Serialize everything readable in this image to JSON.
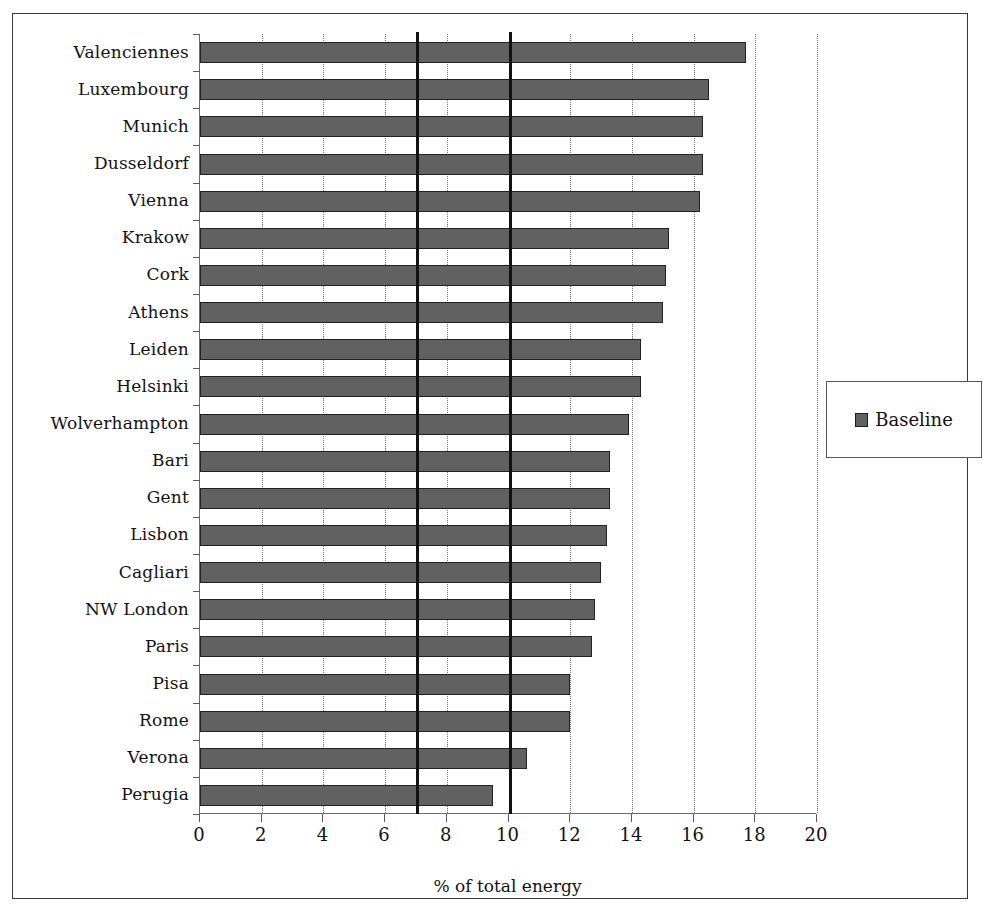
{
  "chart_data": {
    "type": "bar",
    "orientation": "horizontal",
    "title": "",
    "xlabel": "% of total energy",
    "ylabel": "",
    "xlim": [
      0,
      20
    ],
    "ylim": null,
    "grid": true,
    "grid_axis": "x",
    "xticks": [
      0,
      2,
      4,
      6,
      8,
      10,
      12,
      14,
      16,
      18,
      20
    ],
    "xtick_labels": [
      "0",
      "2",
      "4",
      "6",
      "8",
      "10",
      "12",
      "14",
      "16",
      "18",
      "20"
    ],
    "legend": {
      "position": "right",
      "entries": [
        {
          "label": "Baseline",
          "color": "#616161"
        }
      ]
    },
    "reference_lines": [
      {
        "value": 7,
        "color": "#111111"
      },
      {
        "value": 10,
        "color": "#111111"
      }
    ],
    "categories": [
      "Valenciennes",
      "Luxembourg",
      "Munich",
      "Dusseldorf",
      "Vienna",
      "Krakow",
      "Cork",
      "Athens",
      "Leiden",
      "Helsinki",
      "Wolverhampton",
      "Bari",
      "Gent",
      "Lisbon",
      "Cagliari",
      "NW London",
      "Paris",
      "Pisa",
      "Rome",
      "Verona",
      "Perugia"
    ],
    "series": [
      {
        "name": "Baseline",
        "color": "#616161",
        "values": [
          17.7,
          16.5,
          16.3,
          16.3,
          16.2,
          15.2,
          15.1,
          15.0,
          14.3,
          14.3,
          13.9,
          13.3,
          13.3,
          13.2,
          13.0,
          12.8,
          12.7,
          12.0,
          12.0,
          10.6,
          9.5
        ]
      }
    ]
  },
  "legend": {
    "baseline_label": "Baseline"
  },
  "axis": {
    "x_title": "% of total energy"
  }
}
